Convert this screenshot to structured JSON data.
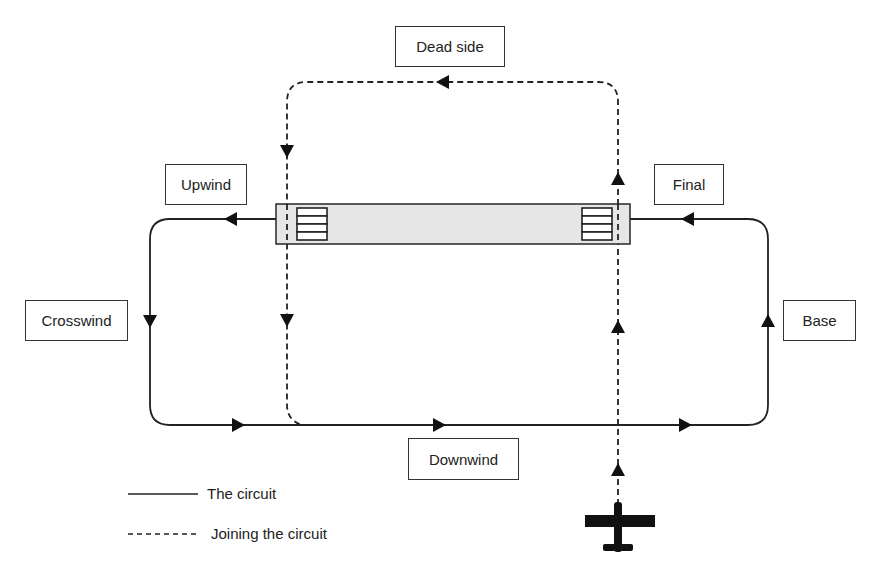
{
  "diagram": {
    "labels": {
      "dead_side": "Dead side",
      "upwind": "Upwind",
      "final": "Final",
      "crosswind": "Crosswind",
      "base": "Base",
      "downwind": "Downwind"
    },
    "legend": {
      "solid": "The circuit",
      "dashed": "Joining the circuit"
    },
    "colors": {
      "line": "#222222",
      "runway_fill": "#e6e6e6",
      "runway_border": "#333333"
    },
    "icons": {
      "aircraft": "aircraft-icon",
      "arrow": "arrow-head-icon",
      "threshold": "threshold-markings-icon"
    }
  }
}
